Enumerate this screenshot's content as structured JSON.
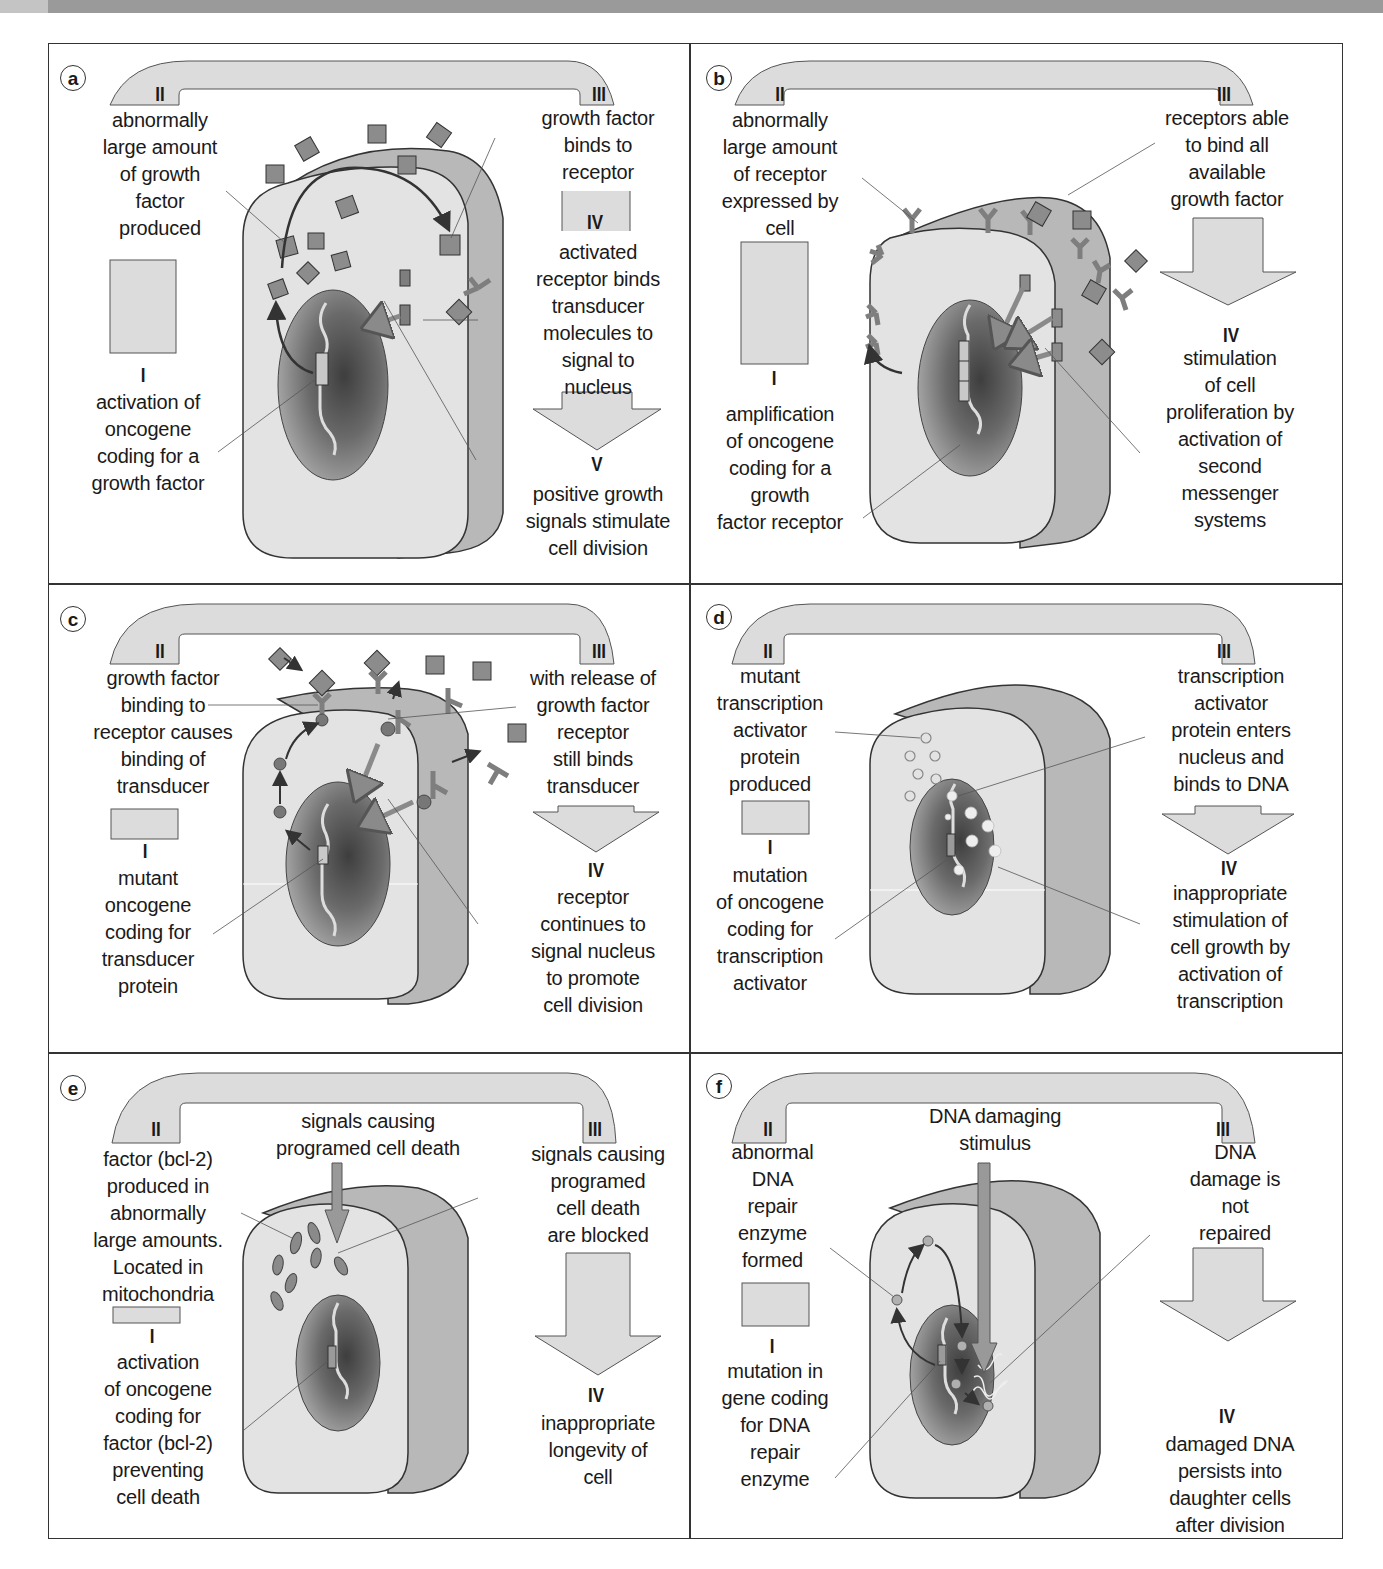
{
  "figure": {
    "colors": {
      "frame": "#333333",
      "cell_front": "#e3e3e3",
      "cell_side": "#b9b9b9",
      "nucleus_dark": "#4a4a4a",
      "nucleus_light": "#9c9c9c",
      "flow_arrow": "#d9d9d9",
      "molecule": "#8a8a8a",
      "topbar": "#9a9a9a"
    },
    "panels": [
      {
        "id": "a",
        "badge": "a",
        "step_I": "I",
        "step_II": "II",
        "step_III": "III",
        "step_IV": "IV",
        "step_V": "V",
        "label_I": "activation of\noncogene\ncoding for a\ngrowth factor",
        "label_II": "abnormally\nlarge amount\nof growth\nfactor\nproduced",
        "label_III": "growth factor\nbinds to\nreceptor",
        "label_IV": "activated\nreceptor binds\ntransducer\nmolecules to\nsignal to\nnucleus",
        "label_V": "positive growth\nsignals stimulate\ncell division",
        "icons": [
          "growth-factor-cube",
          "receptor",
          "transducer",
          "oncogene-dna"
        ]
      },
      {
        "id": "b",
        "badge": "b",
        "step_I": "I",
        "step_II": "II",
        "step_III": "III",
        "step_IV": "IV",
        "label_I": "amplification\nof oncogene\ncoding for a\ngrowth\nfactor receptor",
        "label_II": "abnormally\nlarge amount\nof receptor\nexpressed by\ncell",
        "label_III": "receptors able\nto bind all\navailable\ngrowth factor",
        "label_IV": "stimulation\nof cell\nproliferation by\nactivation of\nsecond\nmessenger\nsystems",
        "icons": [
          "receptor",
          "growth-factor-cube",
          "amplified-oncogene-dna"
        ]
      },
      {
        "id": "c",
        "badge": "c",
        "step_I": "I",
        "step_II": "II",
        "step_III": "III",
        "step_IV": "IV",
        "label_I": "mutant\noncogene\ncoding for\ntransducer\nprotein",
        "label_II": "growth factor\nbinding to\nreceptor causes\nbinding of\ntransducer",
        "label_III": "with release of\ngrowth factor\nreceptor\nstill binds\ntransducer",
        "label_IV": "receptor\ncontinues to\nsignal nucleus\nto promote\ncell division",
        "icons": [
          "growth-factor-cube",
          "receptor",
          "transducer-protein",
          "oncogene-dna"
        ]
      },
      {
        "id": "d",
        "badge": "d",
        "step_I": "I",
        "step_II": "II",
        "step_III": "III",
        "step_IV": "IV",
        "label_I": "mutation\nof oncogene\ncoding for\ntranscription\nactivator",
        "label_II": "mutant\ntranscription\nactivator\nprotein\nproduced",
        "label_III": "transcription\nactivator\nprotein enters\nnucleus and\nbinds to DNA",
        "label_IV": "inappropriate\nstimulation of\ncell growth by\nactivation of\ntranscription",
        "icons": [
          "transcription-activator-protein",
          "oncogene-dna"
        ]
      },
      {
        "id": "e",
        "badge": "e",
        "step_I": "I",
        "step_II": "II",
        "step_III": "III",
        "step_IV": "IV",
        "label_top": "signals causing\nprogramed cell death",
        "label_I": "activation\nof oncogene\ncoding for\nfactor (bcl-2)\npreventing\ncell death",
        "label_II": "factor (bcl-2)\nproduced in\nabnormally\nlarge amounts.\nLocated in\nmitochondria",
        "label_III": "signals causing\nprogramed\ncell death\nare blocked",
        "label_IV": "inappropriate\nlongevity of\ncell",
        "icons": [
          "mitochondria",
          "death-signal-arrow",
          "oncogene-dna"
        ]
      },
      {
        "id": "f",
        "badge": "f",
        "step_I": "I",
        "step_II": "II",
        "step_III": "III",
        "step_IV": "IV",
        "label_top": "DNA damaging\nstimulus",
        "label_I": "mutation in\ngene coding\nfor DNA\nrepair\nenzyme",
        "label_II": "abnormal\nDNA\nrepair\nenzyme\nformed",
        "label_III": "DNA\ndamage is\nnot\nrepaired",
        "label_IV": "damaged DNA\npersists into\ndaughter cells\nafter division",
        "icons": [
          "repair-enzyme",
          "damage-stimulus-arrow",
          "damaged-dna",
          "oncogene-dna"
        ]
      }
    ]
  }
}
